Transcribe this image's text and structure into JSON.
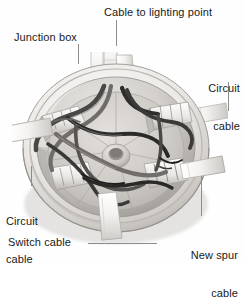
{
  "figure": {
    "type": "annotated-photograph",
    "background_color": "#ffffff",
    "palette": {
      "text": "#1a1a1a",
      "leader_line": "#8d8d8d",
      "box_body_light": "#f2f0ee",
      "box_body_mid": "#d8d5d2",
      "box_body_shadow": "#a9a5a1",
      "box_interior": "#bfbcb8",
      "cable_sheath_white": "#f6f5f3",
      "wire_dark": "#2b2b2b",
      "wire_grey": "#6d6a67"
    },
    "labels": [
      {
        "id": "junction-box",
        "text": "Junction box",
        "position": "top-left",
        "align": "left",
        "leader": "vertical"
      },
      {
        "id": "cable-to-lighting-point",
        "text": "Cable to lighting point",
        "position": "top-center",
        "align": "left",
        "leader": "vertical"
      },
      {
        "id": "circuit-cable-right",
        "text": "Circuit\ncable",
        "line1": "Circuit",
        "line2": "cable",
        "position": "right",
        "align": "right",
        "leader": "vertical"
      },
      {
        "id": "circuit-cable-left",
        "text": "Circuit\ncable",
        "line1": "Circuit",
        "line2": "cable",
        "position": "bottom-left",
        "align": "left",
        "leader": "vertical"
      },
      {
        "id": "switch-cable",
        "text": "Switch cable",
        "position": "bottom-left",
        "align": "left",
        "leader": "horizontal"
      },
      {
        "id": "new-spur-cable",
        "text": "New spur\ncable",
        "line1": "New spur",
        "line2": "cable",
        "position": "bottom-right",
        "align": "right",
        "leader": "vertical"
      }
    ],
    "cable_entries": [
      {
        "name": "cable-to-lighting-point",
        "clock_position": "12 o'clock"
      },
      {
        "name": "circuit-cable-right",
        "clock_position": "3 o'clock"
      },
      {
        "name": "new-spur-cable",
        "clock_position": "4 o'clock"
      },
      {
        "name": "switch-cable",
        "clock_position": "6 o'clock"
      },
      {
        "name": "circuit-cable-left",
        "clock_position": "9 o'clock"
      }
    ]
  }
}
